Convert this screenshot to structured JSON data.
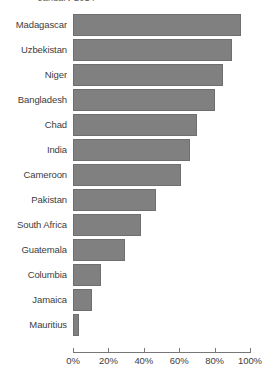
{
  "chart_data": {
    "type": "bar",
    "orientation": "horizontal",
    "title": "January 2014",
    "title_clipped": true,
    "categories": [
      "Madagascar",
      "Uzbekistan",
      "Niger",
      "Bangladesh",
      "Chad",
      "India",
      "Cameroon",
      "Pakistan",
      "South Africa",
      "Guatemala",
      "Columbia",
      "Jamaica",
      "Mauritius"
    ],
    "values": [
      95,
      90,
      85,
      80,
      70,
      66,
      61,
      47,
      38.5,
      29.5,
      16,
      11,
      3.5
    ],
    "value_unit": "%",
    "xlabel": "",
    "ylabel": "",
    "xlim": [
      0,
      100
    ],
    "xticks": [
      0,
      20,
      40,
      60,
      80,
      100
    ],
    "xtick_labels": [
      "0%",
      "20%",
      "40%",
      "60%",
      "80%",
      "100%"
    ],
    "grid": false,
    "legend": false,
    "bar_color": "#808080",
    "bar_edge_color": "#6f6f6f",
    "axis_color": "#777777",
    "text_color": "#3d3d3d"
  }
}
